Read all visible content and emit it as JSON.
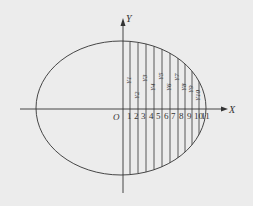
{
  "diagram": {
    "axis_labels": {
      "x": "X",
      "y": "Y",
      "origin": "O"
    },
    "tick_labels": [
      "1",
      "2",
      "3",
      "4",
      "5",
      "6",
      "7",
      "8",
      "9",
      "10",
      "11"
    ],
    "strip_labels": [
      "Y1",
      "Y2",
      "Y3",
      "Y4",
      "Y5",
      "Y6",
      "Y7",
      "Y8",
      "Y9",
      "Y10"
    ],
    "colors": {
      "line": "#333333",
      "background": "#ececec"
    }
  }
}
